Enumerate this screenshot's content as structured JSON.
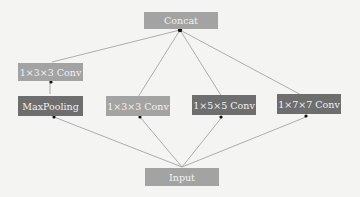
{
  "diagram": {
    "nodes": {
      "concat": {
        "label": "Concat",
        "color": "#a3a3a3"
      },
      "conv_pool": {
        "label": "1×3×3 Conv",
        "color": "#a3a3a3"
      },
      "maxpool": {
        "label": "MaxPooling",
        "color": "#6e6e6e"
      },
      "conv3": {
        "label": "1×3×3 Conv",
        "color": "#a3a3a3"
      },
      "conv5": {
        "label": "1×5×5 Conv",
        "color": "#6e6e6e"
      },
      "conv7": {
        "label": "1×7×7 Conv",
        "color": "#6e6e6e"
      },
      "input": {
        "label": "Input",
        "color": "#a3a3a3"
      }
    },
    "edges": [
      {
        "from": "input",
        "to": "maxpool"
      },
      {
        "from": "input",
        "to": "conv3"
      },
      {
        "from": "input",
        "to": "conv5"
      },
      {
        "from": "input",
        "to": "conv7"
      },
      {
        "from": "maxpool",
        "to": "conv_pool"
      },
      {
        "from": "conv_pool",
        "to": "concat"
      },
      {
        "from": "conv3",
        "to": "concat"
      },
      {
        "from": "conv5",
        "to": "concat"
      },
      {
        "from": "conv7",
        "to": "concat"
      }
    ]
  }
}
